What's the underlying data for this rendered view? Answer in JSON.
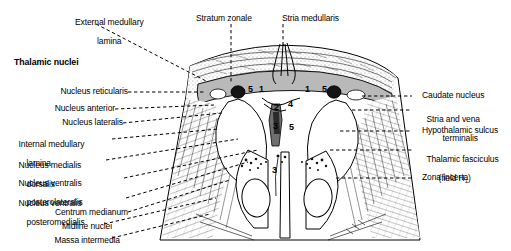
{
  "figure": {
    "title_bold": "Thalamic nuclei",
    "type": "anatomical-cross-section",
    "colors": {
      "ink": "#000000",
      "background": "#ffffff",
      "grey_band": "#b9b9b9",
      "leader": "#000000"
    },
    "top_labels": [
      {
        "text": "Stratum zonale",
        "x": 196,
        "y": 14
      },
      {
        "text": "Stria medullaris",
        "x": 282,
        "y": 14
      }
    ],
    "corner_label": {
      "line1": "External medullary",
      "line2": "lamina"
    },
    "left_labels": [
      {
        "lines": [
          "Nucleus reticularis"
        ]
      },
      {
        "lines": [
          "Nucleus anterior"
        ]
      },
      {
        "lines": [
          "Nucleus lateralis"
        ]
      },
      {
        "lines": [
          "Internal medullary",
          "lamina"
        ]
      },
      {
        "lines": [
          "Nucleus medialis",
          "dorsalis"
        ]
      },
      {
        "lines": [
          "Nucleus ventralis",
          "posterolateralis"
        ]
      },
      {
        "lines": [
          "Nucleus ventralis",
          "posteromedialis"
        ]
      },
      {
        "lines": [
          "Centrum medianum"
        ]
      },
      {
        "lines": [
          "Midline nuclei"
        ]
      },
      {
        "lines": [
          "Massa intermedia"
        ]
      }
    ],
    "right_labels": [
      {
        "lines": [
          "Caudate nucleus"
        ]
      },
      {
        "lines": [
          "Stria and vena",
          "terminalis"
        ]
      },
      {
        "lines": [
          "Hypothalamic sulcus"
        ]
      },
      {
        "lines": [
          "Thalamic fasciculus",
          "(field H1)"
        ]
      },
      {
        "lines": [
          "Zona incerta"
        ]
      }
    ],
    "inline_numbers": [
      {
        "value": "5",
        "x": 248,
        "y": 92,
        "light": true
      },
      {
        "value": "1",
        "x": 259,
        "y": 92,
        "light": true
      },
      {
        "value": "1",
        "x": 305,
        "y": 92,
        "light": true
      },
      {
        "value": "5",
        "x": 322,
        "y": 92,
        "light": true
      },
      {
        "value": "2",
        "x": 274,
        "y": 110,
        "light": false
      },
      {
        "value": "4",
        "x": 288,
        "y": 107,
        "light": false
      },
      {
        "value": "3",
        "x": 273,
        "y": 129,
        "light": false
      },
      {
        "value": "5",
        "x": 289,
        "y": 130,
        "light": false
      },
      {
        "value": "3",
        "x": 272,
        "y": 173,
        "light": false
      }
    ]
  }
}
